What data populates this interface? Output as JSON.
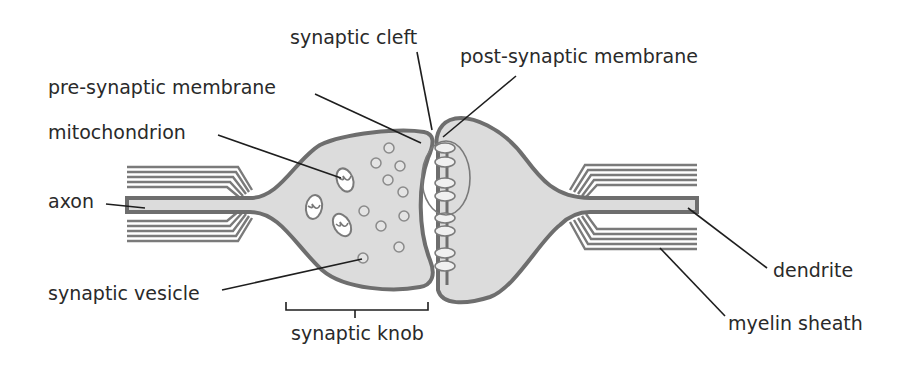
{
  "diagram": {
    "labels": {
      "synaptic_cleft": "synaptic cleft",
      "post_synaptic_membrane": "post-synaptic membrane",
      "pre_synaptic_membrane": "pre-synaptic membrane",
      "mitochondrion": "mitochondrion",
      "axon": "axon",
      "synaptic_vesicle": "synaptic vesicle",
      "synaptic_knob": "synaptic knob",
      "dendrite": "dendrite",
      "myelin_sheath": "myelin sheath"
    },
    "colors": {
      "cell_fill": "#dcdcdc",
      "membrane_stroke": "#6e6e6e",
      "leader_line": "#1e1e1e",
      "text": "#2a2a2a",
      "background": "#ffffff"
    }
  }
}
